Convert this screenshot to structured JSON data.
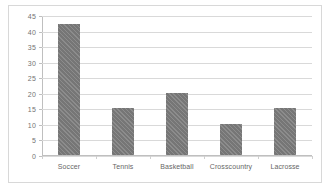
{
  "chart_data": {
    "type": "bar",
    "title": "",
    "subtitle": "",
    "xlabel": "",
    "ylabel": "",
    "categories": [
      "Soccer",
      "Tennis",
      "Basketball",
      "Crosscountry",
      "Lacrosse"
    ],
    "values": [
      42,
      15,
      20,
      10,
      15
    ],
    "ylim": [
      0,
      45
    ],
    "ytick_step": 5,
    "yticks": [
      0,
      5,
      10,
      15,
      20,
      25,
      30,
      35,
      40,
      45
    ],
    "ytick_labels": [
      "0",
      "5",
      "10",
      "15",
      "20",
      "25",
      "30",
      "35",
      "40",
      "45"
    ],
    "grid": "horizontal",
    "legend": "none",
    "series": [
      {
        "name": "",
        "values": [
          42,
          15,
          20,
          10,
          15
        ]
      }
    ],
    "colors": {
      "bar_fill": "#767676",
      "gridline": "#d9d9d9",
      "axis": "#bfbfbf",
      "tick_text": "#737373",
      "category_text": "#666666",
      "frame_border": "#d8d8d8",
      "background": "#ffffff"
    }
  }
}
